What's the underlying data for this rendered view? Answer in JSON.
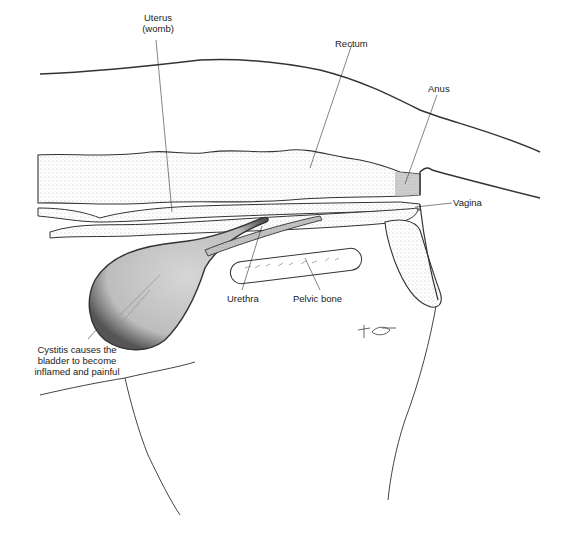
{
  "diagram": {
    "type": "anatomical-illustration",
    "style": "stippled pen-and-ink",
    "background": "#ffffff",
    "ink_color": "#222222",
    "bladder_fill": "#cfcfcf",
    "labels": {
      "uterus": {
        "line1": "Uterus",
        "line2": "(womb)"
      },
      "rectum": "Rectum",
      "anus": "Anus",
      "vagina": "Vagina",
      "urethra": "Urethra",
      "pelvic_bone": "Pelvic bone",
      "cystitis": {
        "line1": "Cystitis causes the",
        "line2": "bladder to become",
        "line3": "inflamed and painful"
      }
    },
    "structures": [
      "back-outline",
      "rectum",
      "uterus",
      "vagina",
      "bladder",
      "urethra",
      "pelvic-bone",
      "vulva",
      "hind-leg-outline",
      "belly-outline",
      "artist-signature"
    ]
  }
}
